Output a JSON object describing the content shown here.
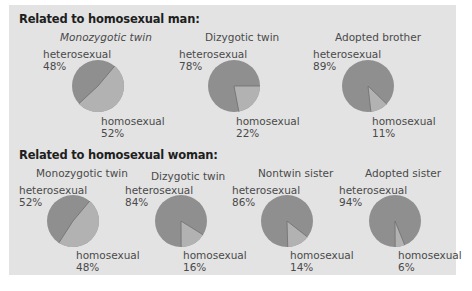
{
  "colors": {
    "panel": "#e3e3e3",
    "heterosexual": "#8f8f8f",
    "homosexual": "#b2b2b2",
    "divider": "#6e6e6e"
  },
  "sections": [
    {
      "title": "Related to homosexual man:",
      "charts": [
        {
          "title": "Monozygotic twin",
          "hetero_label": "heterosexual",
          "hetero_pct": "48%",
          "homo_label": "homosexual",
          "homo_pct": "52%"
        },
        {
          "title": "Dizygotic twin",
          "hetero_label": "heterosexual",
          "hetero_pct": "78%",
          "homo_label": "homosexual",
          "homo_pct": "22%"
        },
        {
          "title": "Adopted brother",
          "hetero_label": "heterosexual",
          "hetero_pct": "89%",
          "homo_label": "homosexual",
          "homo_pct": "11%"
        }
      ]
    },
    {
      "title": "Related to homosexual woman:",
      "charts": [
        {
          "title": "Monozygotic twin",
          "hetero_label": "heterosexual",
          "hetero_pct": "52%",
          "homo_label": "homosexual",
          "homo_pct": "48%"
        },
        {
          "title": "Dizygotic twin",
          "hetero_label": "heterosexual",
          "hetero_pct": "84%",
          "homo_label": "homosexual",
          "homo_pct": "16%"
        },
        {
          "title": "Nontwin sister",
          "hetero_label": "heterosexual",
          "hetero_pct": "86%",
          "homo_label": "homosexual",
          "homo_pct": "14%"
        },
        {
          "title": "Adopted sister",
          "hetero_label": "heterosexual",
          "hetero_pct": "94%",
          "homo_label": "homosexual",
          "homo_pct": "6%"
        }
      ]
    }
  ],
  "chart_data": [
    {
      "type": "pie",
      "title": "Related to homosexual man: Monozygotic twin",
      "categories": [
        "heterosexual",
        "homosexual"
      ],
      "values": [
        48,
        52
      ]
    },
    {
      "type": "pie",
      "title": "Related to homosexual man: Dizygotic twin",
      "categories": [
        "heterosexual",
        "homosexual"
      ],
      "values": [
        78,
        22
      ]
    },
    {
      "type": "pie",
      "title": "Related to homosexual man: Adopted brother",
      "categories": [
        "heterosexual",
        "homosexual"
      ],
      "values": [
        89,
        11
      ]
    },
    {
      "type": "pie",
      "title": "Related to homosexual woman: Monozygotic twin",
      "categories": [
        "heterosexual",
        "homosexual"
      ],
      "values": [
        52,
        48
      ]
    },
    {
      "type": "pie",
      "title": "Related to homosexual woman: Dizygotic twin",
      "categories": [
        "heterosexual",
        "homosexual"
      ],
      "values": [
        84,
        16
      ]
    },
    {
      "type": "pie",
      "title": "Related to homosexual woman: Nontwin sister",
      "categories": [
        "heterosexual",
        "homosexual"
      ],
      "values": [
        86,
        14
      ]
    },
    {
      "type": "pie",
      "title": "Related to homosexual woman: Adopted sister",
      "categories": [
        "heterosexual",
        "homosexual"
      ],
      "values": [
        94,
        6
      ]
    }
  ]
}
